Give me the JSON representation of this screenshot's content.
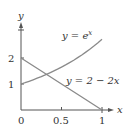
{
  "chart_data": {
    "type": "line",
    "title": "",
    "xlabel": "x",
    "ylabel": "y",
    "xlim": [
      0,
      1.05
    ],
    "ylim": [
      0,
      3
    ],
    "grid": false,
    "legend": "inline labels",
    "x_ticks": [
      "0",
      "0.5",
      "1"
    ],
    "y_ticks": [
      "1",
      "2"
    ],
    "series": [
      {
        "name": "y = e^x",
        "label": "y = e",
        "label_sup": "x",
        "x": [
          0,
          0.25,
          0.5,
          0.75,
          1
        ],
        "values": [
          1,
          1.284,
          1.649,
          2.117,
          2.718
        ]
      },
      {
        "name": "y = 2 − 2x",
        "label": "y = 2 − 2x",
        "x": [
          0,
          0.25,
          0.5,
          0.75,
          1
        ],
        "values": [
          2,
          1.5,
          1,
          0.5,
          0
        ]
      }
    ],
    "annotations": [
      "intersection near x ≈ 0.32, y ≈ 1.37"
    ]
  }
}
